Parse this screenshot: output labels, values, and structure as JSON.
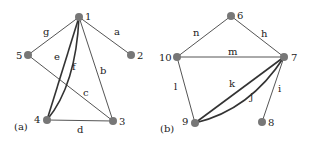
{
  "figure": {
    "panels": [
      {
        "label": "(a)",
        "nodes": [
          {
            "id": "1",
            "x": 79,
            "y": 17
          },
          {
            "id": "2",
            "x": 131,
            "y": 55
          },
          {
            "id": "3",
            "x": 113,
            "y": 121
          },
          {
            "id": "4",
            "x": 47,
            "y": 120
          },
          {
            "id": "5",
            "x": 28,
            "y": 55
          }
        ],
        "edges": [
          {
            "label": "a",
            "from": "1",
            "to": "2"
          },
          {
            "label": "b",
            "from": "1",
            "to": "3"
          },
          {
            "label": "c",
            "from": "5",
            "to": "3"
          },
          {
            "label": "d",
            "from": "4",
            "to": "3"
          },
          {
            "label": "e",
            "from": "1",
            "to": "4"
          },
          {
            "label": "f",
            "from": "1",
            "to": "4",
            "curved": true
          },
          {
            "label": "g",
            "from": "1",
            "to": "5"
          }
        ]
      },
      {
        "label": "(b)",
        "nodes": [
          {
            "id": "6",
            "x": 231,
            "y": 16
          },
          {
            "id": "7",
            "x": 284,
            "y": 57
          },
          {
            "id": "8",
            "x": 262,
            "y": 122
          },
          {
            "id": "9",
            "x": 195,
            "y": 123
          },
          {
            "id": "10",
            "x": 177,
            "y": 57
          }
        ],
        "edges": [
          {
            "label": "h",
            "from": "6",
            "to": "7"
          },
          {
            "label": "i",
            "from": "7",
            "to": "8"
          },
          {
            "label": "j",
            "from": "7",
            "to": "9",
            "curved": true
          },
          {
            "label": "k",
            "from": "7",
            "to": "9"
          },
          {
            "label": "l",
            "from": "10",
            "to": "9"
          },
          {
            "label": "m",
            "from": "10",
            "to": "7"
          },
          {
            "label": "n",
            "from": "10",
            "to": "6"
          }
        ]
      }
    ]
  }
}
